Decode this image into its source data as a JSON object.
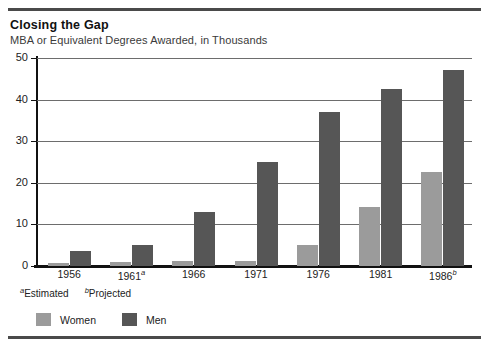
{
  "title": "Closing the Gap",
  "subtitle": "MBA or Equivalent Degrees Awarded, in Thousands",
  "footnotes": [
    {
      "marker": "a",
      "text": "Estimated"
    },
    {
      "marker": "b",
      "text": "Projected"
    }
  ],
  "legend": [
    {
      "label": "Women",
      "color": "#9b9b9b"
    },
    {
      "label": "Men",
      "color": "#565656"
    }
  ],
  "chart_data": {
    "type": "bar",
    "title": "Closing the Gap",
    "subtitle": "MBA or Equivalent Degrees Awarded, in Thousands",
    "xlabel": "",
    "ylabel": "",
    "ylim": [
      0,
      50
    ],
    "yticks": [
      0,
      10,
      20,
      30,
      40,
      50
    ],
    "ytick_labels": [
      "0",
      "10",
      "20",
      "30",
      "40",
      "50"
    ],
    "grid": true,
    "legend_position": "bottom-left",
    "categories": [
      "1956",
      "1961",
      "1966",
      "1971",
      "1976",
      "1981",
      "1986"
    ],
    "category_labels": [
      "1956",
      "1961",
      "1966",
      "1971",
      "1976",
      "1981",
      "1986"
    ],
    "category_markers": [
      "",
      "a",
      "",
      "",
      "",
      "",
      "b"
    ],
    "series": [
      {
        "name": "Women",
        "color": "#9b9b9b",
        "values": [
          0.7,
          1.0,
          1.2,
          1.3,
          5.0,
          14.2,
          22.5
        ]
      },
      {
        "name": "Men",
        "color": "#565656",
        "values": [
          3.5,
          5.0,
          13.0,
          25.0,
          37.0,
          42.5,
          47.0
        ]
      }
    ]
  }
}
